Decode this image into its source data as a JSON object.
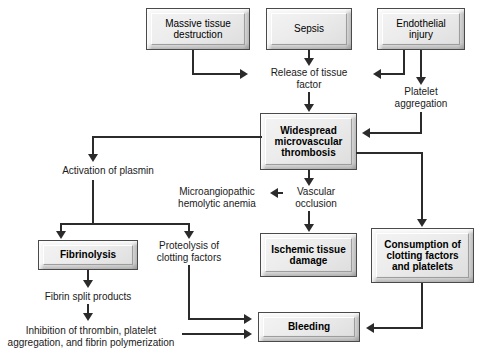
{
  "diagram": {
    "type": "flowchart",
    "accent_color": "#2b2b2b",
    "box_fill": "#ececec",
    "box_border": "#4a4a4a"
  },
  "boxes": {
    "massive_tissue_destruction": "Massive tissue destruction",
    "sepsis": "Sepsis",
    "endothelial_injury": "Endothelial injury",
    "widespread_microvascular_thrombosis": "Widespread microvascular thrombosis",
    "fibrinolysis": "Fibrinolysis",
    "ischemic_tissue_damage": "Ischemic tissue damage",
    "consumption_of_clotting_factors": "Consumption of clotting factors and platelets",
    "bleeding": "Bleeding"
  },
  "labels": {
    "release_of_tissue_factor": "Release of tissue factor",
    "platelet_aggregation": "Platelet aggregation",
    "activation_of_plasmin": "Activation of plasmin",
    "microangiopathic_hemolytic_anemia": "Microangiopathic hemolytic anemia",
    "vascular_occlusion": "Vascular occlusion",
    "proteolysis_of_clotting_factors": "Proteolysis of clotting factors",
    "fibrin_split_products": "Fibrin split products",
    "inhibition_of_thrombin": "Inhibition of thrombin, platelet aggregation, and fibrin polymerization"
  },
  "label_lines": {
    "release_of_tissue_factor": [
      "Release of tissue",
      "factor"
    ],
    "platelet_aggregation": [
      "Platelet",
      "aggregation"
    ],
    "activation_of_plasmin": [
      "Activation of plasmin"
    ],
    "microangiopathic_hemolytic_anemia": [
      "Microangiopathic",
      "hemolytic anemia"
    ],
    "vascular_occlusion": [
      "Vascular",
      "occlusion"
    ],
    "proteolysis_of_clotting_factors": [
      "Proteolysis of",
      "clotting factors"
    ],
    "fibrin_split_products": [
      "Fibrin split products"
    ],
    "inhibition_of_thrombin": [
      "Inhibition of thrombin, platelet",
      "aggregation, and fibrin polymerization"
    ]
  },
  "box_lines": {
    "massive_tissue_destruction": [
      "Massive tissue",
      "destruction"
    ],
    "sepsis": [
      "Sepsis"
    ],
    "endothelial_injury": [
      "Endothelial",
      "injury"
    ],
    "widespread_microvascular_thrombosis": [
      "Widespread",
      "microvascular",
      "thrombosis"
    ],
    "fibrinolysis": [
      "Fibrinolysis"
    ],
    "ischemic_tissue_damage": [
      "Ischemic tissue",
      "damage"
    ],
    "consumption_of_clotting_factors": [
      "Consumption of",
      "clotting factors",
      "and platelets"
    ],
    "bleeding": [
      "Bleeding"
    ]
  },
  "edges": [
    {
      "from": "massive_tissue_destruction",
      "to": "release_of_tissue_factor"
    },
    {
      "from": "sepsis",
      "to": "release_of_tissue_factor"
    },
    {
      "from": "endothelial_injury",
      "to": "release_of_tissue_factor"
    },
    {
      "from": "endothelial_injury",
      "to": "platelet_aggregation"
    },
    {
      "from": "release_of_tissue_factor",
      "to": "widespread_microvascular_thrombosis"
    },
    {
      "from": "platelet_aggregation",
      "to": "widespread_microvascular_thrombosis"
    },
    {
      "from": "widespread_microvascular_thrombosis",
      "to": "activation_of_plasmin"
    },
    {
      "from": "widespread_microvascular_thrombosis",
      "to": "vascular_occlusion"
    },
    {
      "from": "widespread_microvascular_thrombosis",
      "to": "consumption_of_clotting_factors"
    },
    {
      "from": "vascular_occlusion",
      "to": "microangiopathic_hemolytic_anemia"
    },
    {
      "from": "vascular_occlusion",
      "to": "ischemic_tissue_damage"
    },
    {
      "from": "activation_of_plasmin",
      "to": "fibrinolysis"
    },
    {
      "from": "activation_of_plasmin",
      "to": "proteolysis_of_clotting_factors"
    },
    {
      "from": "fibrinolysis",
      "to": "fibrin_split_products"
    },
    {
      "from": "fibrin_split_products",
      "to": "inhibition_of_thrombin"
    },
    {
      "from": "proteolysis_of_clotting_factors",
      "to": "bleeding"
    },
    {
      "from": "inhibition_of_thrombin",
      "to": "bleeding"
    },
    {
      "from": "consumption_of_clotting_factors",
      "to": "bleeding"
    }
  ]
}
